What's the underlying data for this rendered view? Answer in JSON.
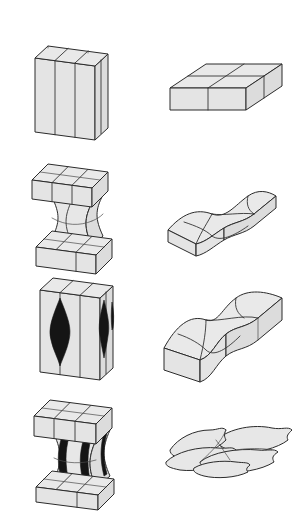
{
  "figure": {
    "background_color": "#ffffff",
    "line_color": "#2b2b2b",
    "grain_fill": "#e7e7e7",
    "void_fill": "#151515",
    "columns": [
      {
        "id": "left",
        "label": "specimen side view"
      },
      {
        "id": "right",
        "label": "grain structure view"
      }
    ],
    "rows": [
      {
        "id": "row-1",
        "stage_number": "1",
        "stage_label": "Undeformed equiaxed block",
        "left": {
          "shape_name": "undeformed-prismatic-block",
          "description": "Tall rectangular prism subdivided into four columnar grains",
          "grain_count": 4,
          "voids": 0,
          "necked": false
        },
        "right": {
          "shape_name": "flat-slab-four-grains",
          "description": "Flat slab in isometric view with four equiaxed grains on top face",
          "grain_count": 4,
          "boundaries_straight": true
        }
      },
      {
        "id": "row-2",
        "stage_number": "2",
        "stage_label": "Uniform necking by grain-boundary sliding",
        "left": {
          "shape_name": "necked-block-no-voids",
          "description": "Block with hourglass neck between upper and lower slabs, no cavities",
          "grain_count": 4,
          "voids": 0,
          "necked": true
        },
        "right": {
          "shape_name": "wavy-slab-four-grains",
          "description": "Slab with gently undulating top surface and curved grain boundaries",
          "grain_count": 4,
          "boundaries_straight": false
        }
      },
      {
        "id": "row-3",
        "stage_number": "3",
        "stage_label": "Cavity nucleation on grain boundaries",
        "left": {
          "shape_name": "block-with-lens-cavities",
          "description": "Prismatic block containing dark lenticular cavities on vertical grain boundaries",
          "grain_count": 4,
          "voids": 2,
          "void_shape": "lens",
          "necked": false
        },
        "right": {
          "shape_name": "stepped-wavy-slab",
          "description": "Slab with pronounced stepped and buckled top surface, offset grains",
          "grain_count": 4,
          "boundaries_straight": false
        }
      },
      {
        "id": "row-4",
        "stage_number": "4",
        "stage_label": "Cavity growth, coalescence and failure",
        "left": {
          "shape_name": "necked-block-with-cracks",
          "description": "Strongly necked block with elongated black cracks running through the neck",
          "grain_count": 4,
          "voids": 2,
          "void_shape": "elongated-crack",
          "necked": true
        },
        "right": {
          "shape_name": "lenticular-flattened-grains",
          "description": "Cluster of flattened, overlapping lens-shaped grains, fully separated slab",
          "grain_count": 4,
          "boundaries_straight": false
        }
      }
    ]
  }
}
